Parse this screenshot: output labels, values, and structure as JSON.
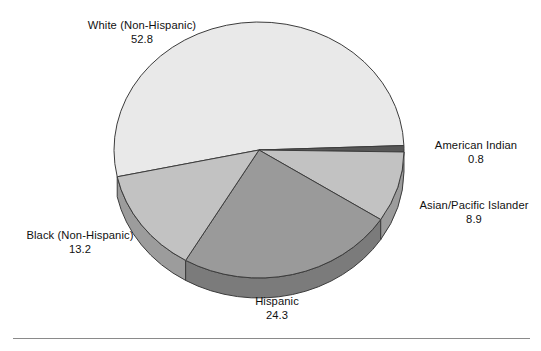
{
  "chart_data": {
    "type": "pie",
    "title": "",
    "subtitle": "",
    "xlabel": "",
    "ylabel": "",
    "legend_position": "none",
    "grid": false,
    "style": "3d-pie",
    "value_unit": "percent",
    "total": 100.0,
    "categories": [
      "White (Non-Hispanic)",
      "American Indian",
      "Asian/Pacific Islander",
      "Hispanic",
      "Black (Non-Hispanic)"
    ],
    "values": [
      52.8,
      0.8,
      8.9,
      24.3,
      13.2
    ],
    "slices": [
      {
        "label": "White (Non-Hispanic)",
        "value": "52.8",
        "value_num": 52.8,
        "color": "#e9e9e9",
        "side_color": "#bcbcbc",
        "label_position": "top-left"
      },
      {
        "label": "American Indian",
        "value": "0.8",
        "value_num": 0.8,
        "color": "#575757",
        "side_color": "#454545",
        "label_position": "right-upper"
      },
      {
        "label": "Asian/Pacific Islander",
        "value": "8.9",
        "value_num": 8.9,
        "color": "#c2c2c2",
        "side_color": "#9c9c9c",
        "label_position": "right-lower"
      },
      {
        "label": "Hispanic",
        "value": "24.3",
        "value_num": 24.3,
        "color": "#9a9a9a",
        "side_color": "#7b7b7b",
        "label_position": "bottom"
      },
      {
        "label": "Black (Non-Hispanic)",
        "value": "13.2",
        "value_num": 13.2,
        "color": "#c2c2c2",
        "side_color": "#9c9c9c",
        "label_position": "left-lower"
      }
    ]
  },
  "labels": {
    "white": {
      "name": "White (Non-Hispanic)",
      "value": "52.8"
    },
    "american_indian": {
      "name": "American Indian",
      "value": "0.8"
    },
    "asian_pacific": {
      "name": "Asian/Pacific Islander",
      "value": "8.9"
    },
    "black": {
      "name": "Black (Non-Hispanic)",
      "value": "13.2"
    },
    "hispanic": {
      "name": "Hispanic",
      "value": "24.3"
    }
  },
  "colors": {
    "outline": "#3c3c3c",
    "text": "#111111",
    "background": "#ffffff",
    "rule": "#8a8a8a"
  }
}
